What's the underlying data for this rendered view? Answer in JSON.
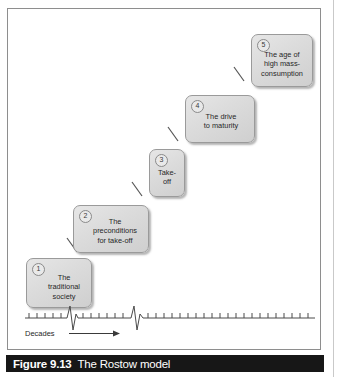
{
  "figure": {
    "caption_number": "Figure 9.13",
    "caption_title": "The Rostow model"
  },
  "diagram": {
    "stages": [
      {
        "number": "1",
        "label": "The\ntraditional\nsociety"
      },
      {
        "number": "2",
        "label": "The\npreconditions\nfor take-off"
      },
      {
        "number": "3",
        "label": "Take-\noff"
      },
      {
        "number": "4",
        "label": "The drive\nto maturity"
      },
      {
        "number": "5",
        "label": "The age of\nhigh mass-\nconsumption"
      }
    ],
    "axis": {
      "label": "Decades",
      "arrow": "right-arrow",
      "tick_count": 27,
      "break_marks": 2
    }
  },
  "colors": {
    "box_fill": "#dcdcdc",
    "box_border": "#9a9a9a",
    "caption_bar": "#171717",
    "caption_text": "#ffffff",
    "frame_border": "#8e8e8e",
    "axis_line": "#4a4a4a"
  }
}
